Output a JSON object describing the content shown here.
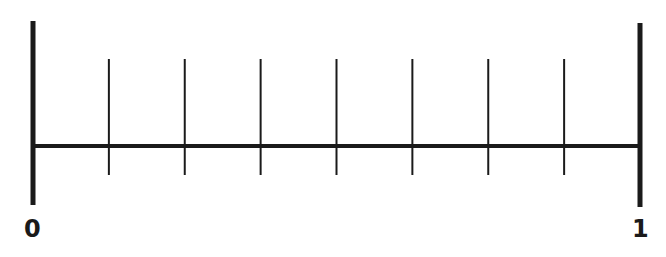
{
  "diagram": {
    "type": "number-line",
    "start_label": "0",
    "end_label": "1",
    "divisions": 8,
    "interior_ticks": 7,
    "line_color": "#1a1a1a",
    "background": "#ffffff"
  },
  "chart_data": {
    "type": "number-line",
    "range": [
      0,
      1
    ],
    "labels": [
      {
        "value": 0,
        "text": "0"
      },
      {
        "value": 1,
        "text": "1"
      }
    ],
    "tick_values": [
      0.125,
      0.25,
      0.375,
      0.5,
      0.625,
      0.75,
      0.875
    ],
    "divisions": 8
  }
}
